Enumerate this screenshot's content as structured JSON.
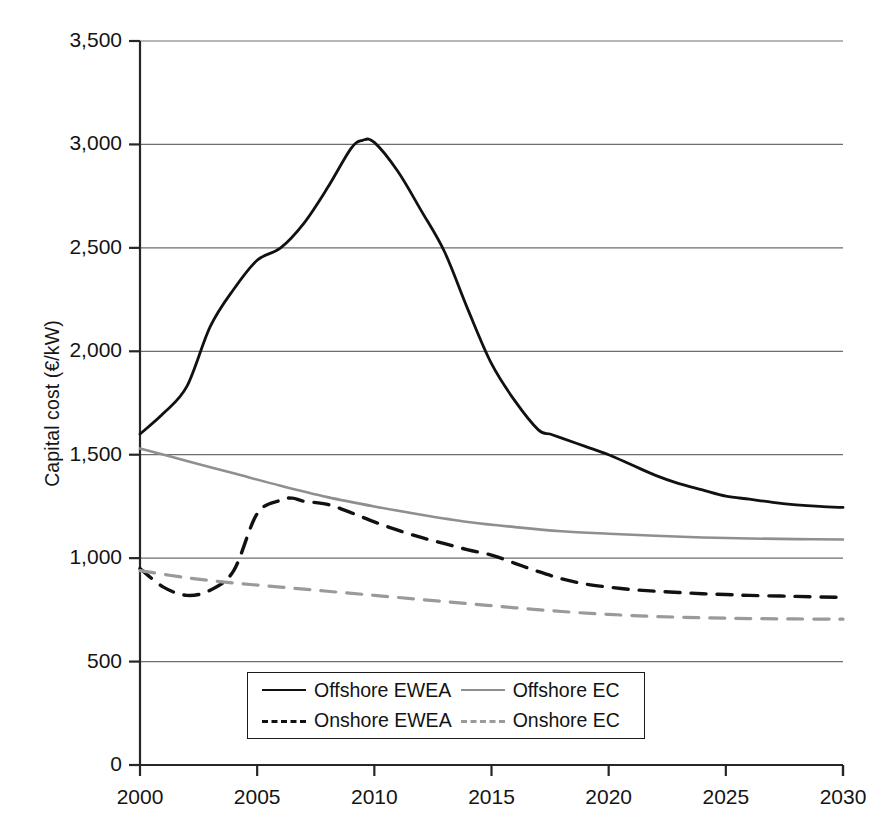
{
  "chart_data": {
    "type": "line",
    "title": "",
    "xlabel": "",
    "ylabel": "Capital cost (€/kW)",
    "xlim": [
      2000,
      2030
    ],
    "ylim": [
      0,
      3500
    ],
    "grid": true,
    "legend_position": "bottom-center",
    "x_ticks": [
      "2000",
      "2005",
      "2010",
      "2015",
      "2020",
      "2025",
      "2030"
    ],
    "x_tick_values": [
      2000,
      2005,
      2010,
      2015,
      2020,
      2025,
      2030
    ],
    "y_ticks": [
      "0",
      "500",
      "1,000",
      "1,500",
      "2,000",
      "2,500",
      "3,000",
      "3,500"
    ],
    "y_tick_values": [
      0,
      500,
      1000,
      1500,
      2000,
      2500,
      3000,
      3500
    ],
    "series": [
      {
        "name": "Offshore EWEA",
        "style": "solid",
        "color": "#111111",
        "width": 2.8,
        "x": [
          2000,
          2001,
          2002,
          2003,
          2004,
          2005,
          2006,
          2007,
          2008,
          2009,
          2009.5,
          2010,
          2011,
          2012,
          2013,
          2014,
          2015,
          2016,
          2017,
          2017.5,
          2018,
          2019,
          2020,
          2021,
          2022,
          2023,
          2024,
          2025,
          2026,
          2027,
          2028,
          2029,
          2030
        ],
        "y": [
          1600,
          1700,
          1830,
          2120,
          2300,
          2440,
          2500,
          2620,
          2790,
          2980,
          3020,
          3010,
          2870,
          2680,
          2480,
          2200,
          1940,
          1760,
          1620,
          1600,
          1580,
          1540,
          1500,
          1450,
          1400,
          1360,
          1330,
          1300,
          1285,
          1270,
          1258,
          1250,
          1245
        ]
      },
      {
        "name": "Offshore EC",
        "style": "solid",
        "color": "#8f8f8f",
        "width": 2.6,
        "x": [
          2000,
          2002,
          2004,
          2006,
          2008,
          2010,
          2012,
          2014,
          2016,
          2018,
          2020,
          2022,
          2024,
          2026,
          2028,
          2030
        ],
        "y": [
          1530,
          1470,
          1410,
          1350,
          1295,
          1250,
          1210,
          1175,
          1150,
          1130,
          1118,
          1108,
          1100,
          1095,
          1092,
          1090
        ]
      },
      {
        "name": "Onshore EWEA",
        "style": "dashed",
        "color": "#111111",
        "width": 3.4,
        "x": [
          2000,
          2001,
          2002,
          2003,
          2004,
          2005,
          2006,
          2006.5,
          2007,
          2008,
          2009,
          2010,
          2011,
          2012,
          2013,
          2014,
          2015,
          2016,
          2017,
          2018,
          2019,
          2020,
          2021,
          2022,
          2023,
          2024,
          2025,
          2026,
          2028,
          2030
        ],
        "y": [
          950,
          860,
          820,
          845,
          940,
          1215,
          1280,
          1290,
          1275,
          1260,
          1220,
          1175,
          1135,
          1100,
          1070,
          1040,
          1015,
          975,
          935,
          900,
          875,
          860,
          848,
          840,
          834,
          828,
          824,
          820,
          815,
          810
        ]
      },
      {
        "name": "Onshore EC",
        "style": "dashed",
        "color": "#9a9a9a",
        "width": 3.2,
        "x": [
          2000,
          2002,
          2004,
          2006,
          2008,
          2010,
          2012,
          2014,
          2016,
          2018,
          2020,
          2022,
          2024,
          2026,
          2028,
          2030
        ],
        "y": [
          940,
          905,
          880,
          860,
          840,
          820,
          800,
          780,
          760,
          742,
          728,
          718,
          712,
          708,
          706,
          705
        ]
      }
    ],
    "legend": [
      {
        "label": "Offshore EWEA",
        "style": "solid",
        "color": "#111111"
      },
      {
        "label": "Offshore EC",
        "style": "solid",
        "color": "#8f8f8f"
      },
      {
        "label": "Onshore EWEA",
        "style": "dashed",
        "color": "#111111"
      },
      {
        "label": "Onshore EC",
        "style": "dashed",
        "color": "#9a9a9a"
      }
    ]
  }
}
